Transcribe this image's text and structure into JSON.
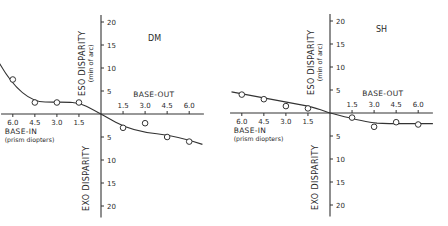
{
  "chart_data": [
    {
      "type": "line",
      "title": "DM",
      "xlabel_left": "BASE-IN",
      "xlabel_left_sub": "(prism diopters)",
      "xlabel_right": "BASE-OUT",
      "ylabel_top": "ESO DISPARITY",
      "ylabel_top_sub": "(min of arc)",
      "ylabel_bottom": "EXO DISPARITY",
      "x_ticks_left": [
        "6.0",
        "4.5",
        "3.0",
        "1.5"
      ],
      "x_ticks_right": [
        "1.5",
        "3.0",
        "4.5",
        "6.0"
      ],
      "y_ticks_up": [
        "5",
        "10",
        "15",
        "20"
      ],
      "y_ticks_down": [
        "5",
        "10",
        "15",
        "20"
      ],
      "x": [
        -6.0,
        -4.5,
        -3.0,
        -1.5,
        1.5,
        3.0,
        4.5,
        6.0
      ],
      "values": [
        7.5,
        2.5,
        2.5,
        2.5,
        -3.0,
        -2.0,
        -5.0,
        -6.0
      ],
      "xlim": [
        -6.5,
        7.0
      ],
      "ylim": [
        -20,
        20
      ],
      "marker": "open-circle",
      "fit_curve": "smooth sigmoid through origin"
    },
    {
      "type": "line",
      "title": "SH",
      "xlabel_left": "BASE-IN",
      "xlabel_left_sub": "(prism diopters)",
      "xlabel_right": "BASE-OUT",
      "ylabel_top": "ESO DISPARITY",
      "ylabel_top_sub": "(min of arc)",
      "ylabel_bottom": "EXO DISPARITY",
      "x_ticks_left": [
        "6.0",
        "4.5",
        "3.0",
        "1.5"
      ],
      "x_ticks_right": [
        "1.5",
        "3.0",
        "4.5",
        "6.0"
      ],
      "y_ticks_up": [
        "5",
        "10",
        "15",
        "20"
      ],
      "y_ticks_down": [
        "5",
        "10",
        "15",
        "20"
      ],
      "x": [
        -6.0,
        -4.5,
        -3.0,
        -1.5,
        1.5,
        3.0,
        4.5,
        6.0
      ],
      "values": [
        4.0,
        3.0,
        1.5,
        1.0,
        -1.0,
        -3.0,
        -2.0,
        -2.5
      ],
      "xlim": [
        -6.5,
        7.0
      ],
      "ylim": [
        -20,
        20
      ],
      "marker": "open-circle",
      "fit_curve": "smooth sigmoid through origin"
    }
  ]
}
